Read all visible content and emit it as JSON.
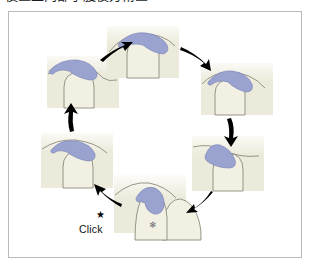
{
  "caption": {
    "text": "後區上肉部子腹後方術區"
  },
  "figure": {
    "frame_border_color": "#b9b9b9",
    "background_color": "#ffffff",
    "colors": {
      "lesion_blue": "#9aa3cf",
      "lesion_blue_stroke": "#7b85b8",
      "skin_cream": "#eceada",
      "outline_gray": "#7a7a6e",
      "arrow_black": "#000000",
      "text_black": "#111111"
    },
    "labels": [
      {
        "name": "click",
        "text": "Click",
        "x": 70,
        "y": 211
      },
      {
        "name": "star",
        "text": "★",
        "x": 87,
        "y": 198
      },
      {
        "name": "snowflake",
        "text": "❄",
        "x": 140,
        "y": 209
      }
    ],
    "panels": [
      {
        "id": "panel-top",
        "position": "top",
        "index": 1,
        "x": 98,
        "y": 14,
        "w": 72,
        "h": 52,
        "lesion": "dome-centered-top"
      },
      {
        "id": "panel-upper-right",
        "position": "upper-right",
        "index": 2,
        "x": 192,
        "y": 51,
        "w": 72,
        "h": 52,
        "lesion": "dome-tilted-right"
      },
      {
        "id": "panel-lower-right",
        "position": "lower-right",
        "index": 3,
        "x": 183,
        "y": 124,
        "w": 72,
        "h": 55,
        "lesion": "teardrop-right"
      },
      {
        "id": "panel-bottom",
        "position": "bottom",
        "index": 4,
        "x": 105,
        "y": 163,
        "w": 72,
        "h": 58,
        "lesion": "comma-bottom"
      },
      {
        "id": "panel-lower-left",
        "position": "lower-left",
        "index": 5,
        "x": 32,
        "y": 121,
        "w": 72,
        "h": 55,
        "lesion": "oval-left"
      },
      {
        "id": "panel-upper-left",
        "position": "upper-left",
        "index": 6,
        "x": 38,
        "y": 44,
        "w": 72,
        "h": 52,
        "lesion": "dome-tilted-left"
      }
    ],
    "arrows": [
      {
        "id": "arrow-upperleft-to-top",
        "from": "panel-upper-left",
        "to": "panel-top",
        "direction": "clockwise"
      },
      {
        "id": "arrow-top-to-upperright",
        "from": "panel-top",
        "to": "panel-upper-right",
        "direction": "clockwise"
      },
      {
        "id": "arrow-upperright-to-lowerright",
        "from": "panel-upper-right",
        "to": "panel-lower-right",
        "direction": "clockwise"
      },
      {
        "id": "arrow-lowerright-to-bottom",
        "from": "panel-lower-right",
        "to": "panel-bottom",
        "direction": "clockwise"
      },
      {
        "id": "arrow-bottom-to-lowerleft",
        "from": "panel-bottom",
        "to": "panel-lower-left",
        "direction": "clockwise"
      },
      {
        "id": "arrow-lowerleft-to-upperleft",
        "from": "panel-lower-left",
        "to": "panel-upper-left",
        "direction": "clockwise"
      }
    ]
  }
}
